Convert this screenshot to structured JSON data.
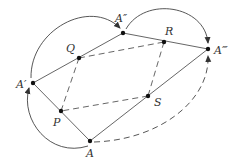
{
  "diagram": {
    "title": "",
    "colors": {
      "stroke": "#444444",
      "point": "#111111",
      "label": "#333333",
      "background": "#ffffff"
    },
    "points": [
      {
        "id": "A1",
        "label": "A′",
        "x": 33,
        "y": 83
      },
      {
        "id": "A2",
        "label": "A″",
        "x": 123,
        "y": 33
      },
      {
        "id": "A3",
        "label": "A‴",
        "x": 208,
        "y": 49
      },
      {
        "id": "A",
        "label": "A",
        "x": 90,
        "y": 141
      },
      {
        "id": "P",
        "label": "P",
        "x": 61,
        "y": 111
      },
      {
        "id": "Q",
        "label": "Q",
        "x": 79,
        "y": 58
      },
      {
        "id": "R",
        "label": "R",
        "x": 164,
        "y": 42
      },
      {
        "id": "S",
        "label": "S",
        "x": 148,
        "y": 96
      }
    ],
    "labels": {
      "A1": "A′",
      "A2": "A″",
      "A3": "A‴",
      "A": "A",
      "P": "P",
      "Q": "Q",
      "R": "R",
      "S": "S"
    },
    "solid_segments": [
      [
        "A",
        "A1"
      ],
      [
        "A1",
        "A2"
      ],
      [
        "A2",
        "A3"
      ],
      [
        "A",
        "A3"
      ]
    ],
    "dashed_segments": [
      [
        "P",
        "Q"
      ],
      [
        "Q",
        "R"
      ],
      [
        "R",
        "S"
      ],
      [
        "S",
        "P"
      ]
    ],
    "curved_arrows": [
      {
        "from": "A",
        "to": "A1",
        "style": "solid"
      },
      {
        "from": "A1",
        "to": "A2",
        "style": "solid"
      },
      {
        "from": "A2",
        "to": "A3",
        "style": "solid"
      },
      {
        "from": "A",
        "to": "A3",
        "style": "dashed"
      }
    ]
  }
}
